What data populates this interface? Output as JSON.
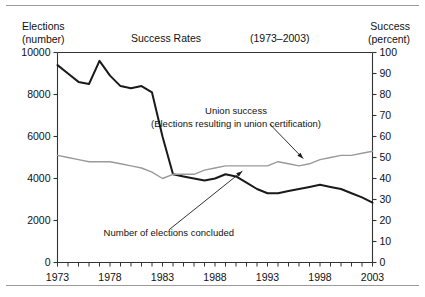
{
  "header": {
    "left_line1": "Elections",
    "left_line2": "(number)",
    "center_title": "Success Rates",
    "period": "(1973–2003)",
    "right_line1": "Success",
    "right_line2": "(percent)"
  },
  "chart_data": {
    "type": "line",
    "title": "Success Rates",
    "subtitle": "(1973–2003)",
    "xlabel": "",
    "ylabel": "Elections (number)",
    "y2label": "Success (percent)",
    "grid": false,
    "legend": "annotations",
    "xlim": [
      1973,
      2003
    ],
    "ylim": [
      0,
      10000
    ],
    "y2lim": [
      0,
      100
    ],
    "yticks": [
      0,
      2000,
      4000,
      6000,
      8000,
      10000
    ],
    "y2ticks": [
      0,
      10,
      20,
      30,
      40,
      50,
      60,
      70,
      80,
      90,
      100
    ],
    "xticks_labeled": [
      1973,
      1978,
      1983,
      1988,
      1993,
      1998,
      2003
    ],
    "x": [
      1973,
      1974,
      1975,
      1976,
      1977,
      1978,
      1979,
      1980,
      1981,
      1982,
      1983,
      1984,
      1985,
      1986,
      1987,
      1988,
      1989,
      1990,
      1991,
      1992,
      1993,
      1994,
      1995,
      1996,
      1997,
      1998,
      1999,
      2000,
      2001,
      2002,
      2003
    ],
    "series": [
      {
        "name": "Number of elections concluded",
        "axis": "left",
        "color": "#1a1a1a",
        "width": 2.0,
        "values": [
          9400,
          9000,
          8600,
          8500,
          9600,
          8900,
          8400,
          8300,
          8400,
          8100,
          6000,
          4200,
          4100,
          4000,
          3900,
          4000,
          4200,
          4100,
          3800,
          3500,
          3300,
          3300,
          3400,
          3500,
          3600,
          3700,
          3600,
          3500,
          3300,
          3100,
          2850
        ]
      },
      {
        "name": "Union success (Elections resulting in union certification)",
        "axis": "right",
        "color": "#9a9a9a",
        "width": 1.4,
        "values": [
          51,
          50,
          49,
          48,
          48,
          48,
          47,
          46,
          45,
          43,
          40,
          42,
          42,
          42,
          44,
          45,
          46,
          46,
          46,
          46,
          46,
          48,
          47,
          46,
          47,
          49,
          50,
          51,
          51,
          52,
          53
        ]
      }
    ],
    "annotations": [
      {
        "name": "union-success-annotation",
        "line1": "Union success",
        "line2": "(Elections resulting in union certification)",
        "arrow_from": [
          1993.2,
          66
        ],
        "arrow_to": [
          1996.4,
          49.5
        ]
      },
      {
        "name": "elections-concluded-annotation",
        "line1": "Number of elections concluded",
        "arrow_from": [
          1983.6,
          1550
        ],
        "arrow_to": [
          1990.6,
          4350
        ]
      }
    ]
  }
}
